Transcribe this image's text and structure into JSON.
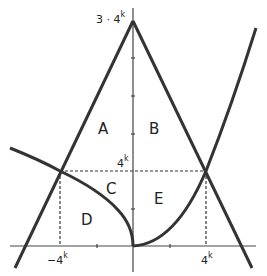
{
  "diagram": {
    "type": "geometric-regions",
    "stroke_color": "#333333",
    "background": "#ffffff",
    "axes": {
      "y_axis_label_top": {
        "base": "3 · 4",
        "exp": "k"
      },
      "y_axis_label_mid": {
        "base": "4",
        "exp": "k"
      },
      "x_axis_label_left": {
        "base": "−4",
        "exp": "k"
      },
      "x_axis_label_right": {
        "base": "4",
        "exp": "k"
      }
    },
    "regions": [
      {
        "id": "A",
        "label": "A"
      },
      {
        "id": "B",
        "label": "B"
      },
      {
        "id": "C",
        "label": "C"
      },
      {
        "id": "D",
        "label": "D"
      },
      {
        "id": "E",
        "label": "E"
      }
    ],
    "curves": [
      {
        "name": "left-line",
        "description": "line from (-4^k, 4^k) rising to apex (0, 3·4^k)"
      },
      {
        "name": "right-line",
        "description": "line from (4^k, 4^k) rising to apex (0, 3·4^k)"
      },
      {
        "name": "left-curve",
        "description": "y = sqrt(-x)-type curve through (-4^k, 4^k) to origin"
      },
      {
        "name": "right-parabola",
        "description": "parabola from origin through (4^k, 4^k)"
      },
      {
        "name": "dashed-horizontal",
        "description": "y = 4^k between intersections"
      },
      {
        "name": "dashed-verticals",
        "description": "x = ±4^k from x-axis to y = 4^k"
      }
    ]
  }
}
